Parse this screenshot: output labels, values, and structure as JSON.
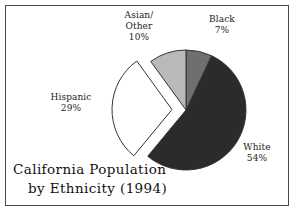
{
  "chart_data": {
    "type": "pie",
    "title": "California Population by Ethnicity (1994)",
    "title_line1": "California Population",
    "title_line2": "by Ethnicity (1994)",
    "categories": [
      "White",
      "Black",
      "Asian/Other",
      "Hispanic"
    ],
    "values": [
      54,
      29,
      10,
      7
    ],
    "slices": [
      {
        "label": "White",
        "label_line1": "White",
        "label_line2": "",
        "value": 54,
        "value_text": "54%",
        "color": "#2b2b2b",
        "exploded": false,
        "start_angle": 25.2,
        "end_angle": 219.6
      },
      {
        "label": "Hispanic",
        "label_line1": "Hispanic",
        "label_line2": "",
        "value": 29,
        "value_text": "29%",
        "color": "#ffffff",
        "exploded": true,
        "start_angle": 219.6,
        "end_angle": 324.0
      },
      {
        "label": "Asian/Other",
        "label_line1": "Asian/",
        "label_line2": "Other",
        "value": 10,
        "value_text": "10%",
        "color": "#b9b9b9",
        "exploded": false,
        "start_angle": 324.0,
        "end_angle": 360.0
      },
      {
        "label": "Black",
        "label_line1": "Black",
        "label_line2": "",
        "value": 7,
        "value_text": "7%",
        "color": "#6f6f6f",
        "exploded": false,
        "start_angle": 0.0,
        "end_angle": 25.2
      }
    ],
    "legend": "none",
    "grid": false,
    "outline_color": "#333333",
    "frame_color": "#4a4a4a",
    "background": "#ffffff"
  }
}
